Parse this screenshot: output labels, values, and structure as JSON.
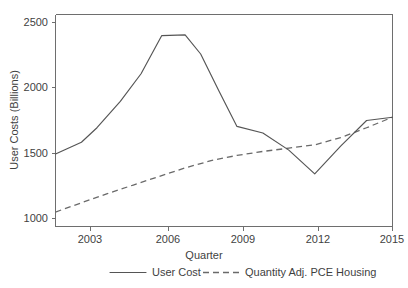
{
  "chart_data": {
    "type": "line",
    "title": "",
    "xlabel": "Quarter",
    "ylabel": "User Costs (Billions)",
    "xlim": [
      2002.0,
      2015.0
    ],
    "ylim": [
      950,
      2560
    ],
    "xticks": [
      2003,
      2006,
      2009,
      2012,
      2015
    ],
    "xtick_labels": [
      "2003",
      "2006",
      "2009",
      "2012",
      "2015"
    ],
    "yticks": [
      1000,
      1500,
      2000,
      2500
    ],
    "ytick_labels": [
      "1000",
      "1500",
      "2000",
      "2500"
    ],
    "grid": false,
    "legend_position": "below",
    "series": [
      {
        "name": "User Cost",
        "style": "solid",
        "color": "#555555",
        "x": [
          2002.0,
          2003.0,
          2003.6,
          2004.5,
          2005.3,
          2006.1,
          2007.0,
          2007.6,
          2008.3,
          2009.0,
          2010.0,
          2011.0,
          2012.0,
          2013.0,
          2014.0,
          2015.0
        ],
        "y": [
          1500,
          1590,
          1700,
          1900,
          2110,
          2400,
          2405,
          2260,
          1980,
          1710,
          1660,
          1530,
          1350,
          1560,
          1755,
          1780
        ]
      },
      {
        "name": "Quantity Adj. PCE Housing",
        "style": "dashed",
        "color": "#6a6a6a",
        "x": [
          2002.0,
          2003.0,
          2004.0,
          2005.0,
          2006.0,
          2007.0,
          2008.0,
          2009.0,
          2010.0,
          2011.0,
          2012.0,
          2013.0,
          2014.0,
          2015.0
        ],
        "y": [
          1060,
          1130,
          1200,
          1265,
          1330,
          1395,
          1450,
          1490,
          1520,
          1545,
          1570,
          1625,
          1700,
          1780
        ]
      }
    ]
  },
  "axes": {
    "y_title": "User Costs (Billions)",
    "x_title": "Quarter",
    "ytick_labels": [
      "2500",
      "2000",
      "1500",
      "1000"
    ],
    "xtick_labels": [
      "2003",
      "2006",
      "2009",
      "2012",
      "2015"
    ]
  },
  "legend": {
    "entries": [
      {
        "label": "User Cost",
        "style": "solid"
      },
      {
        "label": "Quantity Adj. PCE Housing",
        "style": "dashed"
      }
    ]
  }
}
